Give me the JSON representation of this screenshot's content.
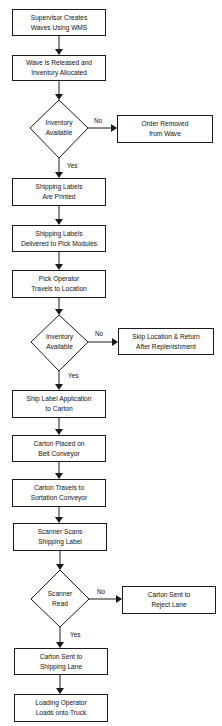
{
  "flowchart": {
    "steps": {
      "s1": "Supervisor Creates\nWaves Using WMS",
      "s2": "Wave Is Released and\nInventory Allocated",
      "d1": "Inventory\nAvailable",
      "d1_no": "Order Removed\nfrom Wave",
      "s3": "Shipping Labels\nAre Printed",
      "s4": "Shipping Labels\nDelivered to Pick Modules",
      "s5": "Pick Operator\nTravels to Location",
      "d2": "Inventory\nAvailable",
      "d2_no": "Skip Location & Return\nAfter Replenishment",
      "s6": "Ship Label  Application\nto  Carton",
      "s7": "Carton Placed on\nBelt Conveyor",
      "s8": "Carton Travels to\nSortation Conveyor",
      "s9": "Scanner Scans\nShipping Label",
      "d3": "Scanner\nRead",
      "d3_no": "Carton Sent to\nReject Lane",
      "s10": "Carton Sent to\nShipping Lane",
      "s11": "Loading Operator\nLoads onto Truck"
    },
    "labels": {
      "yes": "Yes",
      "no": "No"
    },
    "colors": {
      "line": "#1a1a1a",
      "background": "#ffffff"
    }
  }
}
